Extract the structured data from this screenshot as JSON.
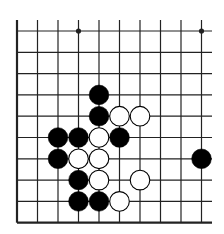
{
  "diagram": {
    "type": "go-board-fragment",
    "columns": 10,
    "rows": 10,
    "open_edges": [
      "top",
      "right"
    ],
    "closed_edges": [
      "left",
      "bottom"
    ],
    "star_points": [
      {
        "col": 3,
        "row": 0
      },
      {
        "col": 9,
        "row": 0
      }
    ],
    "stones": [
      {
        "color": "black",
        "col": 4,
        "row": 3
      },
      {
        "color": "black",
        "col": 4,
        "row": 4
      },
      {
        "color": "white",
        "col": 5,
        "row": 4
      },
      {
        "color": "white",
        "col": 6,
        "row": 4
      },
      {
        "color": "black",
        "col": 2,
        "row": 5
      },
      {
        "color": "black",
        "col": 3,
        "row": 5
      },
      {
        "color": "white",
        "col": 4,
        "row": 5
      },
      {
        "color": "black",
        "col": 5,
        "row": 5
      },
      {
        "color": "black",
        "col": 2,
        "row": 6
      },
      {
        "color": "white",
        "col": 3,
        "row": 6
      },
      {
        "color": "white",
        "col": 4,
        "row": 6
      },
      {
        "color": "black",
        "col": 9,
        "row": 6
      },
      {
        "color": "black",
        "col": 3,
        "row": 7
      },
      {
        "color": "white",
        "col": 4,
        "row": 7
      },
      {
        "color": "white",
        "col": 6,
        "row": 7
      },
      {
        "color": "black",
        "col": 3,
        "row": 8
      },
      {
        "color": "black",
        "col": 4,
        "row": 8
      },
      {
        "color": "white",
        "col": 5,
        "row": 8
      }
    ],
    "colors": {
      "line": "#222222",
      "black_stone": "#000000",
      "white_stone": "#ffffff",
      "background": "#ffffff"
    }
  }
}
